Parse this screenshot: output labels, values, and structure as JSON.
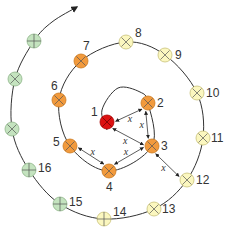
{
  "diagram": {
    "type": "spiral-sequence",
    "colors": {
      "center": "#dd1111",
      "orange": "#f29a3c",
      "yellow": "#fbf7bf",
      "green": "#c4e3bf",
      "line": "#333333"
    },
    "nodes": [
      {
        "id": "1",
        "label": "1",
        "color": "center",
        "x": 107,
        "y": 122,
        "symbol": "x",
        "lx": -16,
        "ly": -6
      },
      {
        "id": "2",
        "label": "2",
        "color": "orange",
        "x": 148,
        "y": 103,
        "symbol": "x",
        "lx": 9,
        "ly": 4
      },
      {
        "id": "3",
        "label": "3",
        "color": "orange",
        "x": 152,
        "y": 146,
        "symbol": "x",
        "lx": 9,
        "ly": 4
      },
      {
        "id": "4",
        "label": "4",
        "color": "orange",
        "x": 109,
        "y": 171,
        "symbol": "x",
        "lx": -3,
        "ly": 20
      },
      {
        "id": "5",
        "label": "5",
        "color": "orange",
        "x": 70,
        "y": 146,
        "symbol": "x",
        "lx": -17,
        "ly": 0
      },
      {
        "id": "6",
        "label": "6",
        "color": "orange",
        "x": 59,
        "y": 100,
        "symbol": "x",
        "lx": -8,
        "ly": -10
      },
      {
        "id": "7",
        "label": "7",
        "color": "orange",
        "x": 81,
        "y": 61,
        "symbol": "x",
        "lx": 2,
        "ly": -11
      },
      {
        "id": "8",
        "label": "8",
        "color": "yellow",
        "x": 126,
        "y": 42,
        "symbol": "x",
        "lx": 9,
        "ly": -5
      },
      {
        "id": "9",
        "label": "9",
        "color": "yellow",
        "x": 165,
        "y": 55,
        "symbol": "x",
        "lx": 10,
        "ly": 4
      },
      {
        "id": "10",
        "label": "10",
        "color": "yellow",
        "x": 197,
        "y": 93,
        "symbol": "x",
        "lx": 9,
        "ly": 4
      },
      {
        "id": "11",
        "label": "11",
        "color": "yellow",
        "x": 203,
        "y": 138,
        "symbol": "x",
        "lx": 8,
        "ly": 4
      },
      {
        "id": "12",
        "label": "12",
        "color": "yellow",
        "x": 187,
        "y": 180,
        "symbol": "x",
        "lx": 9,
        "ly": 4
      },
      {
        "id": "13",
        "label": "13",
        "color": "yellow",
        "x": 154,
        "y": 209,
        "symbol": "x",
        "lx": 8,
        "ly": 4
      },
      {
        "id": "14",
        "label": "14",
        "color": "yellow",
        "x": 104,
        "y": 219,
        "symbol": "plus",
        "lx": 9,
        "ly": -3
      },
      {
        "id": "15",
        "label": "15",
        "color": "green",
        "x": 60,
        "y": 204,
        "symbol": "plus",
        "lx": 9,
        "ly": 2
      },
      {
        "id": "16",
        "label": "16",
        "color": "green",
        "x": 29,
        "y": 170,
        "symbol": "plus",
        "lx": 9,
        "ly": 2
      },
      {
        "id": "17",
        "label": "",
        "color": "green",
        "x": 12,
        "y": 129,
        "symbol": "x",
        "lx": 0,
        "ly": 0
      },
      {
        "id": "18",
        "label": "",
        "color": "green",
        "x": 15,
        "y": 79,
        "symbol": "x",
        "lx": 0,
        "ly": 0
      },
      {
        "id": "19",
        "label": "",
        "color": "green",
        "x": 34,
        "y": 41,
        "symbol": "plus",
        "lx": 0,
        "ly": 0
      }
    ],
    "distance_arrows": [
      {
        "from": "1",
        "to": "2",
        "label": "x"
      },
      {
        "from": "1",
        "to": "3",
        "label": "x"
      },
      {
        "from": "2",
        "to": "3",
        "label": "x"
      },
      {
        "from": "3",
        "to": "4",
        "label": "x"
      },
      {
        "from": "4",
        "to": "5",
        "label": "x"
      },
      {
        "from": "3",
        "to": "12",
        "label": "x"
      }
    ],
    "spiral_direction": "outward"
  }
}
